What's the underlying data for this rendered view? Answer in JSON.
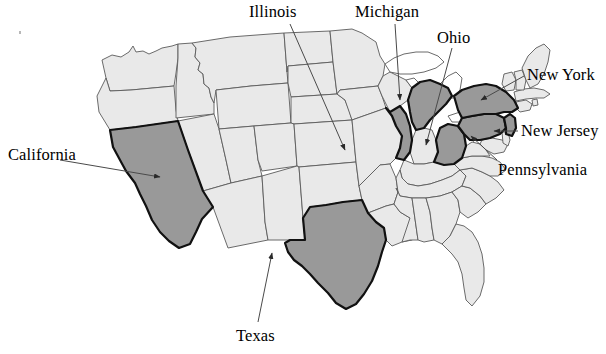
{
  "figure": {
    "type": "choropleth-map",
    "region": "United States of America (contiguous 48 states)",
    "background_color": "#ffffff",
    "highlight_fill": "#999999",
    "base_fill": "#e9e9e9",
    "outline_color": "#5a5a5a",
    "highlight_outline_color": "#111111",
    "lake_fill": "#ffffff"
  },
  "labels": [
    {
      "id": "california",
      "text": "California",
      "x": 8,
      "y": 147,
      "anchor": "left"
    },
    {
      "id": "illinois",
      "text": "Illinois",
      "x": 249,
      "y": 4,
      "anchor": "left"
    },
    {
      "id": "michigan",
      "text": "Michigan",
      "x": 355,
      "y": 4,
      "anchor": "left"
    },
    {
      "id": "ohio",
      "text": "Ohio",
      "x": 437,
      "y": 30,
      "anchor": "left"
    },
    {
      "id": "new-york",
      "text": "New York",
      "x": 527,
      "y": 67,
      "anchor": "left"
    },
    {
      "id": "new-jersey",
      "text": "New Jersey",
      "x": 521,
      "y": 123,
      "anchor": "left"
    },
    {
      "id": "pennsylvania",
      "text": "Pennsylvania",
      "x": 498,
      "y": 162,
      "anchor": "left"
    },
    {
      "id": "texas",
      "text": "Texas",
      "x": 236,
      "y": 328,
      "anchor": "left"
    }
  ],
  "highlighted_states": [
    {
      "code": "CA",
      "name": "California"
    },
    {
      "code": "TX",
      "name": "Texas"
    },
    {
      "code": "IL",
      "name": "Illinois"
    },
    {
      "code": "MI",
      "name": "Michigan"
    },
    {
      "code": "OH",
      "name": "Ohio"
    },
    {
      "code": "NY",
      "name": "New York"
    },
    {
      "code": "NJ",
      "name": "New Jersey"
    },
    {
      "code": "PA",
      "name": "Pennsylvania"
    }
  ],
  "leader_lines": [
    {
      "id": "california-leader",
      "from_label": "California",
      "points": "60,160 160,177",
      "arrow": true
    },
    {
      "id": "illinois-leader",
      "from_label": "Illinois",
      "points": "290,24 345,150",
      "arrow": true
    },
    {
      "id": "michigan-leader",
      "from_label": "Michigan",
      "points": "395,24 400,100",
      "arrow": true
    },
    {
      "id": "ohio-leader",
      "from_label": "Ohio",
      "points": "452,48 425,145",
      "arrow": true
    },
    {
      "id": "new-york-leader",
      "from_label": "New York",
      "points": "524,76 480,100",
      "arrow": true
    },
    {
      "id": "new-jersey-leader",
      "from_label": "New Jersey",
      "points": "518,131 493,131",
      "arrow": true
    },
    {
      "id": "pennsylvania-leader",
      "from_label": "Pennsylvania",
      "points": "497,160 470,135",
      "arrow": true
    },
    {
      "id": "texas-leader",
      "from_label": "Texas",
      "points": "258,322 272,252",
      "arrow": true
    }
  ]
}
